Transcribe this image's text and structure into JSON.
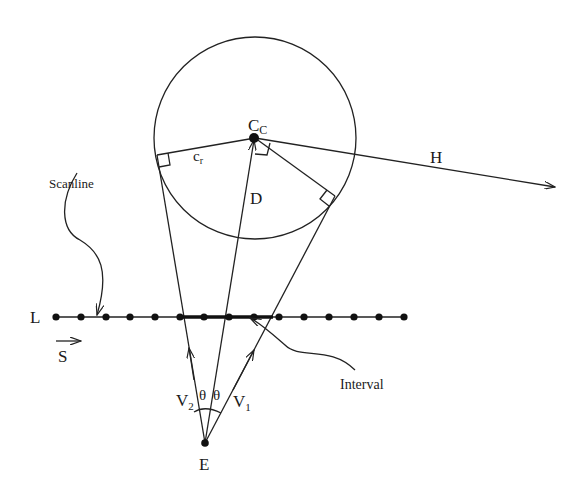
{
  "diagram": {
    "labels": {
      "center": "C",
      "center_sub": "C",
      "radius": "c",
      "radius_sub": "r",
      "distance": "D",
      "horizon": "H",
      "scanline": "Scanline",
      "line": "L",
      "scan_dir": "S",
      "interval": "Interval",
      "v1": "V",
      "v1_sub": "1",
      "v2": "V",
      "v2_sub": "2",
      "theta_left": "θ",
      "theta_right": "θ",
      "eye": "E"
    },
    "geometry": {
      "circle_center": [
        255,
        138
      ],
      "circle_radius": 101,
      "eye": [
        205,
        443
      ],
      "scanline_y": 317,
      "scanline_dots_x": [
        56,
        81,
        106,
        130,
        155,
        180,
        204,
        229,
        254,
        279,
        304,
        329,
        354,
        379,
        404
      ],
      "interval_x": [
        180,
        273
      ],
      "tangent_left": [
        157,
        155
      ],
      "tangent_right": [
        335,
        196
      ],
      "horizon_end": [
        555,
        187
      ]
    },
    "colors": {
      "ink": "#222222",
      "background": "#ffffff"
    }
  }
}
